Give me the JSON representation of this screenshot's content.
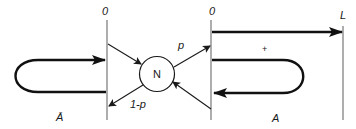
{
  "diagram": {
    "type": "flow/state diagram",
    "labels": {
      "left_wall_origin": "0",
      "right_wall_origin": "0",
      "end_wall": "L",
      "node": "N",
      "prob_out_right": "p",
      "prob_out_left": "1-p",
      "plus_sign": "+",
      "region_right": "A",
      "region_left": "Ā"
    },
    "colors": {
      "line": "#111111",
      "wall": "#777777",
      "background": "#ffffff"
    }
  }
}
